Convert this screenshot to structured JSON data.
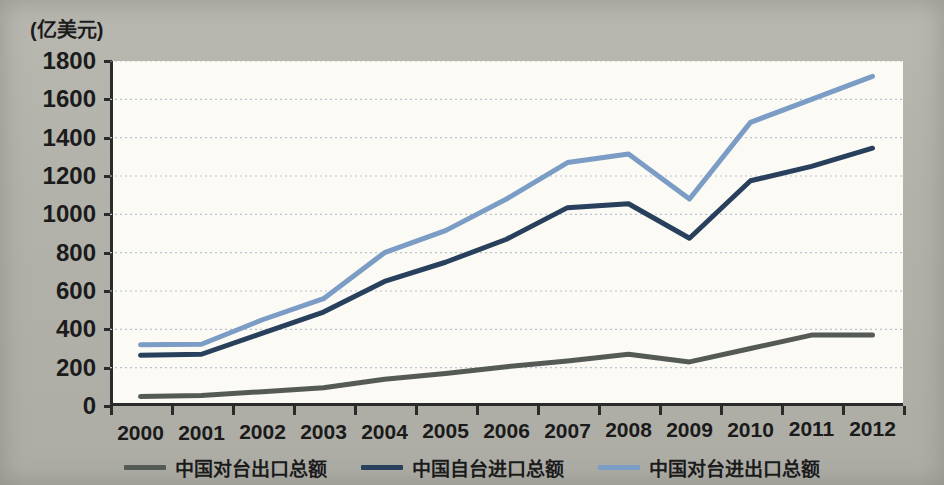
{
  "axis": {
    "unit_label": "(亿美元)",
    "y_ticks": [
      0,
      200,
      400,
      600,
      800,
      1000,
      1200,
      1400,
      1600,
      1800
    ],
    "x_ticks": [
      "2000",
      "2001",
      "2002",
      "2003",
      "2004",
      "2005",
      "2006",
      "2007",
      "2008",
      "2009",
      "2010",
      "2011",
      "2012"
    ]
  },
  "legend": {
    "items": [
      {
        "label": "中国对台出口总额",
        "color": "#555a55"
      },
      {
        "label": "中国自台进口总额",
        "color": "#28405c"
      },
      {
        "label": "中国对台进出口总额",
        "color": "#7b9cc4"
      }
    ]
  },
  "colors": {
    "background": "#b3b3ac",
    "plot_background": "#fbfaf5",
    "axis": "#2b2b2b",
    "gridline": "#b9c2cf",
    "export_line": "#555a55",
    "import_line": "#28405c",
    "total_line": "#7b9cc4"
  },
  "chart_data": {
    "type": "line",
    "title": "",
    "xlabel": "",
    "ylabel": "亿美元",
    "ylim": [
      0,
      1800
    ],
    "ytick_step": 200,
    "grid": true,
    "legend_position": "bottom",
    "x": [
      "2000",
      "2001",
      "2002",
      "2003",
      "2004",
      "2005",
      "2006",
      "2007",
      "2008",
      "2009",
      "2010",
      "2011",
      "2012"
    ],
    "series": [
      {
        "name": "中国对台出口总额",
        "color": "#555a55",
        "values": [
          50,
          55,
          75,
          95,
          140,
          170,
          205,
          235,
          270,
          230,
          300,
          370,
          370
        ]
      },
      {
        "name": "中国自台进口总额",
        "color": "#28405c",
        "values": [
          265,
          270,
          380,
          490,
          650,
          750,
          870,
          1035,
          1055,
          875,
          1175,
          1250,
          1345
        ]
      },
      {
        "name": "中国对台进出口总额",
        "color": "#7b9cc4",
        "values": [
          320,
          322,
          450,
          560,
          800,
          915,
          1080,
          1270,
          1315,
          1080,
          1480,
          1600,
          1720
        ]
      }
    ]
  }
}
